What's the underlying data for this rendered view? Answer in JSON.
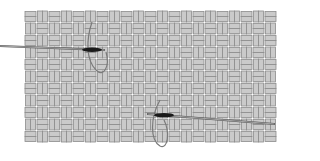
{
  "figure": {
    "type": "illustration",
    "width": 299,
    "height": 161
  },
  "fabric": {
    "x": 24,
    "y": 10,
    "width": 258,
    "height": 141,
    "cell": 12,
    "strip": 5,
    "fill_color": "#cacaca",
    "edge_color": "#8c8c8c",
    "background": "#ffffff"
  },
  "needles": [
    {
      "name": "needle-top-left",
      "x1": 0,
      "y1": 46,
      "x2": 104,
      "y2": 50,
      "eye_x": 84,
      "color": "#1a1a1a"
    },
    {
      "name": "needle-bottom-right",
      "x1": 148,
      "y1": 114,
      "x2": 274,
      "y2": 124,
      "eye_x": 156,
      "color": "#1a1a1a"
    }
  ],
  "threads": [
    {
      "name": "thread-loop-top",
      "path": "M92 22 C 86 40, 86 60, 96 70 C 104 78, 110 66, 106 52",
      "color": "#7a7a7a"
    },
    {
      "name": "thread-loop-bottom",
      "path": "M160 100 C 150 118, 150 140, 160 146 C 168 150, 170 132, 164 120",
      "color": "#7a7a7a"
    }
  ]
}
